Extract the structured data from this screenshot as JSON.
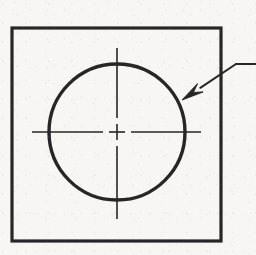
{
  "drawing": {
    "type": "engineering-drawing",
    "title": "Circular feature in square plate with centerlines and leader callout",
    "canvas": {
      "width": 256,
      "height": 255
    },
    "background_color": "#f7f6f4",
    "line_color": "#262626",
    "elements": {
      "plate_outline": {
        "name": "square plate outline",
        "shape": "rectangle",
        "x": 12,
        "y": 28,
        "width": 209,
        "height": 213,
        "stroke_width": 3.2,
        "fill": "none"
      },
      "bore_circle": {
        "name": "bore circle",
        "shape": "circle",
        "center_x": 117,
        "center_y": 132,
        "radius": 68,
        "stroke_width": 3.4,
        "fill": "none"
      },
      "vertical_centerline": {
        "name": "vertical centerline",
        "x": 117,
        "y_start": 48,
        "y_end": 219,
        "stroke_width": 1.6,
        "gap_start": 118,
        "gap_end": 146
      },
      "horizontal_centerline": {
        "name": "horizontal centerline",
        "y": 132,
        "x_start": 32,
        "x_end": 201,
        "stroke_width": 1.6,
        "gap_start": 103,
        "gap_end": 131
      },
      "center_mark": {
        "name": "center cross mark",
        "center_x": 117,
        "center_y": 132,
        "arm_length": 8,
        "stroke_width": 1.6
      },
      "leader_callout": {
        "name": "leader line with arrowhead",
        "arrow_tip_x": 182,
        "arrow_tip_y": 100,
        "elbow_x": 236,
        "elbow_y": 64,
        "tail_end_x": 256,
        "tail_end_y": 64,
        "stroke_width": 2.0,
        "arrowhead_length": 22,
        "arrowhead_half_width": 5
      }
    },
    "annotations": {
      "callout_text": "",
      "dimension_text": ""
    }
  }
}
